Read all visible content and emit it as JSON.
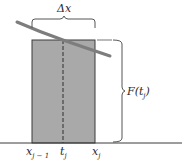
{
  "figure": {
    "type": "riemann-sum-rectangle",
    "colors": {
      "rect_fill": "#a9a9a9",
      "curve": "#7d7d7d",
      "lines": "#3a3a3a",
      "brace": "#555555",
      "background": "#ffffff"
    },
    "labels": {
      "delta_x": "Δx",
      "height": {
        "main": "F(t",
        "sub": "j",
        "close": ")"
      },
      "x_left": {
        "main": "x",
        "sub": "j − 1"
      },
      "t_mid": {
        "main": "t",
        "sub": "j"
      },
      "x_right": {
        "main": "x",
        "sub": "j"
      }
    }
  }
}
